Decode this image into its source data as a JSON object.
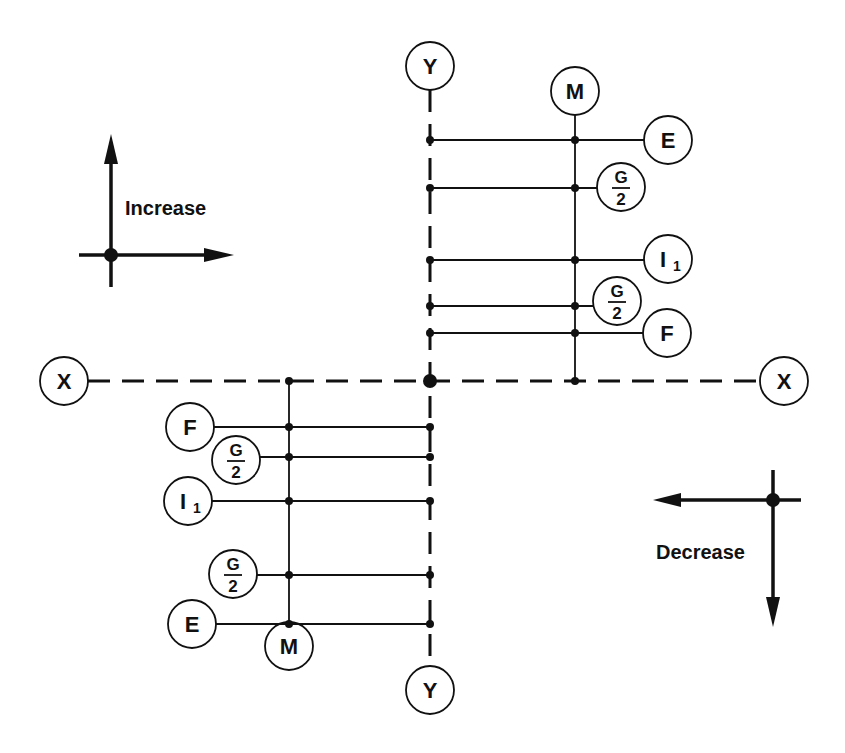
{
  "diagram": {
    "axes": {
      "x_label_left": "X",
      "x_label_right": "X",
      "y_label_top": "Y",
      "y_label_bottom": "Y"
    },
    "upper_right_group": {
      "member_label": "M",
      "items": [
        {
          "label": "E",
          "type": "simple"
        },
        {
          "label": "G",
          "denominator": "2",
          "type": "fraction"
        },
        {
          "label": "I",
          "subscript": "1",
          "type": "subscript"
        },
        {
          "label": "G",
          "denominator": "2",
          "type": "fraction"
        },
        {
          "label": "F",
          "type": "simple"
        }
      ]
    },
    "lower_left_group": {
      "member_label": "M",
      "items": [
        {
          "label": "F",
          "type": "simple"
        },
        {
          "label": "G",
          "denominator": "2",
          "type": "fraction"
        },
        {
          "label": "I",
          "subscript": "1",
          "type": "subscript"
        },
        {
          "label": "G",
          "denominator": "2",
          "type": "fraction"
        },
        {
          "label": "E",
          "type": "simple"
        }
      ]
    },
    "legend": {
      "increase_label": "Increase",
      "decrease_label": "Decrease"
    }
  }
}
